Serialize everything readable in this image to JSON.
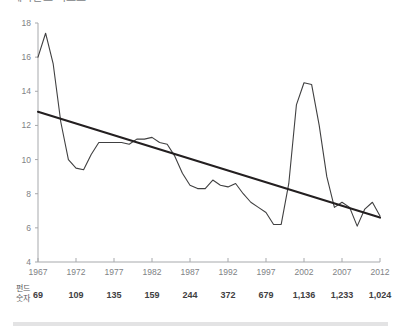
{
  "chart_data": {
    "type": "line",
    "title": "헤지펀드 리포트",
    "xlabel": "",
    "ylabel": "",
    "xlim": [
      1967,
      2012
    ],
    "ylim": [
      4,
      18
    ],
    "grid": false,
    "legend": null,
    "x_tick_labels": [
      "1967",
      "1972",
      "1977",
      "1982",
      "1987",
      "1992",
      "1997",
      "2002",
      "2007",
      "2012"
    ],
    "y_tick_labels": [
      "18",
      "16",
      "14",
      "12",
      "10",
      "8",
      "6",
      "4"
    ],
    "y_ticks": [
      18,
      16,
      14,
      12,
      10,
      8,
      6,
      4
    ],
    "x_ticks": [
      1967,
      1972,
      1977,
      1982,
      1987,
      1992,
      1997,
      2002,
      2007,
      2012
    ],
    "series": [
      {
        "name": "annual-series",
        "style": "thin-line",
        "color": "#404041",
        "x": [
          1967,
          1968,
          1969,
          1970,
          1971,
          1972,
          1973,
          1974,
          1975,
          1976,
          1977,
          1978,
          1979,
          1980,
          1981,
          1982,
          1983,
          1984,
          1985,
          1986,
          1987,
          1988,
          1989,
          1990,
          1991,
          1992,
          1993,
          1994,
          1995,
          1996,
          1997,
          1998,
          1999,
          2000,
          2001,
          2002,
          2003,
          2004,
          2005,
          2006,
          2007,
          2008,
          2009,
          2010,
          2011,
          2012
        ],
        "values": [
          16.0,
          17.4,
          15.6,
          12.2,
          10.0,
          9.5,
          9.4,
          10.3,
          11.0,
          11.0,
          11.0,
          11.0,
          10.9,
          11.2,
          11.2,
          11.3,
          11.0,
          10.9,
          10.2,
          9.2,
          8.5,
          8.3,
          8.3,
          8.8,
          8.5,
          8.4,
          8.6,
          8.0,
          7.5,
          7.2,
          6.9,
          6.2,
          6.2,
          8.6,
          13.2,
          14.5,
          14.4,
          12.0,
          9.0,
          7.2,
          7.5,
          7.2,
          6.1,
          7.1,
          7.5,
          6.7
        ]
      },
      {
        "name": "trend-line",
        "style": "thick-line",
        "color": "#231f20",
        "x": [
          1967,
          2012
        ],
        "values": [
          12.8,
          6.6
        ]
      }
    ],
    "annotations": {
      "row_label": "펀드\n숫자",
      "row_label_line1": "펀드",
      "row_label_line2": "숫자",
      "fund_counts": [
        "69",
        "109",
        "135",
        "159",
        "244",
        "372",
        "679",
        "1,136",
        "1,233",
        "1,024"
      ]
    },
    "colors": {
      "axis": "#a7a9ac",
      "series": "#404041",
      "trend": "#231f20",
      "tick_text": "#808285",
      "bold_text": "#414042",
      "footer": "#e3e3e4"
    }
  }
}
